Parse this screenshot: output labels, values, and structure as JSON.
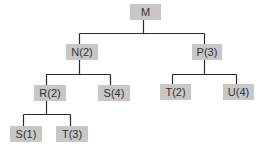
{
  "tree": {
    "nodes": [
      {
        "id": "M",
        "label": "M",
        "x": 130,
        "y": 4,
        "w": 31
      },
      {
        "id": "N2",
        "label": "N(2)",
        "x": 66,
        "y": 44,
        "w": 32
      },
      {
        "id": "P3",
        "label": "P(3)",
        "x": 192,
        "y": 44,
        "w": 30
      },
      {
        "id": "R2",
        "label": "R(2)",
        "x": 34,
        "y": 85,
        "w": 32
      },
      {
        "id": "S4",
        "label": "S(4)",
        "x": 98,
        "y": 85,
        "w": 32
      },
      {
        "id": "T2",
        "label": "T(2)",
        "x": 160,
        "y": 84,
        "w": 31
      },
      {
        "id": "U4",
        "label": "U(4)",
        "x": 223,
        "y": 84,
        "w": 31
      },
      {
        "id": "S1",
        "label": "S(1)",
        "x": 10,
        "y": 126,
        "w": 32
      },
      {
        "id": "T3",
        "label": "T(3)",
        "x": 56,
        "y": 126,
        "w": 32
      }
    ],
    "edges": [
      {
        "parent": "M",
        "children": [
          "N2",
          "P3"
        ]
      },
      {
        "parent": "N2",
        "children": [
          "R2",
          "S4"
        ]
      },
      {
        "parent": "P3",
        "children": [
          "T2",
          "U4"
        ]
      },
      {
        "parent": "R2",
        "children": [
          "S1",
          "T3"
        ]
      }
    ],
    "colors": {
      "node_fill": "#c7c7c7",
      "node_text": "#333333",
      "edge": "#2a2a2a"
    }
  }
}
